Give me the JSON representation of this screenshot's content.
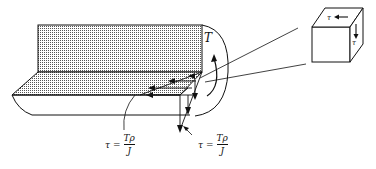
{
  "diagram": {
    "torque_label": "T",
    "formula_left": {
      "lhs": "τ",
      "eq": "=",
      "numerator": "Tρ",
      "denominator": "J"
    },
    "formula_right": {
      "lhs": "τ",
      "eq": "=",
      "numerator": "Tρ",
      "denominator": "J"
    },
    "stress_element": {
      "top_label": "τ",
      "side_label": "τ"
    },
    "colors": {
      "line": "#111111",
      "hatch": "#8a8a8a",
      "background": "#ffffff"
    }
  }
}
